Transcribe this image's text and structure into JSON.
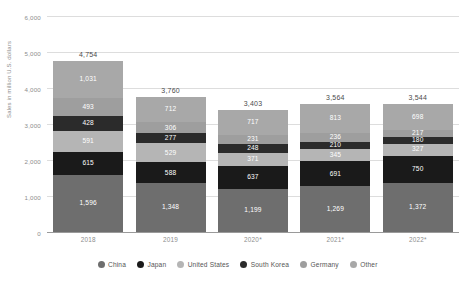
{
  "chart_data": {
    "type": "bar",
    "subtype": "stacked-bar",
    "title": "",
    "xlabel": "",
    "ylabel": "Sales in million U.S. dollars",
    "ylim": [
      0,
      6000
    ],
    "ytick_values": [
      0,
      1000,
      2000,
      3000,
      4000,
      5000,
      6000
    ],
    "ytick_labels": [
      "0",
      "1,000",
      "2,000",
      "3,000",
      "4,000",
      "5,000",
      "6,000"
    ],
    "grid": true,
    "legend_position": "bottom",
    "categories": [
      "2018",
      "2019",
      "2020*",
      "2021*",
      "2022*"
    ],
    "totals": [
      4754,
      3760,
      3403,
      3564,
      3544
    ],
    "total_labels": [
      "4,754",
      "3,760",
      "3,403",
      "3,564",
      "3,544"
    ],
    "series": [
      {
        "name": "China",
        "color": "#6e6e6e",
        "values": [
          1596,
          1348,
          1199,
          1269,
          1372
        ],
        "labels": [
          "1,596",
          "1,348",
          "1,199",
          "1,269",
          "1,372"
        ]
      },
      {
        "name": "Japan",
        "color": "#1a1a1a",
        "values": [
          615,
          588,
          637,
          691,
          750
        ],
        "labels": [
          "615",
          "588",
          "637",
          "691",
          "750"
        ]
      },
      {
        "name": "United States",
        "color": "#b5b5b5",
        "values": [
          591,
          529,
          371,
          345,
          327
        ],
        "labels": [
          "591",
          "529",
          "371",
          "345",
          "327"
        ]
      },
      {
        "name": "South Korea",
        "color": "#2b2b2b",
        "values": [
          428,
          277,
          248,
          210,
          180
        ],
        "labels": [
          "428",
          "277",
          "248",
          "210",
          "180"
        ]
      },
      {
        "name": "Germany",
        "color": "#9e9e9e",
        "values": [
          493,
          306,
          231,
          236,
          217
        ],
        "labels": [
          "493",
          "306",
          "231",
          "236",
          "217"
        ]
      },
      {
        "name": "Other",
        "color": "#a8a8a8",
        "values": [
          1031,
          712,
          717,
          813,
          698
        ],
        "labels": [
          "1,031",
          "712",
          "717",
          "813",
          "698"
        ]
      }
    ]
  },
  "legend": {
    "items": [
      {
        "label": "China",
        "color": "#6e6e6e"
      },
      {
        "label": "Japan",
        "color": "#1a1a1a"
      },
      {
        "label": "United States",
        "color": "#b5b5b5"
      },
      {
        "label": "South Korea",
        "color": "#2b2b2b"
      },
      {
        "label": "Germany",
        "color": "#9e9e9e"
      },
      {
        "label": "Other",
        "color": "#a8a8a8"
      }
    ]
  }
}
